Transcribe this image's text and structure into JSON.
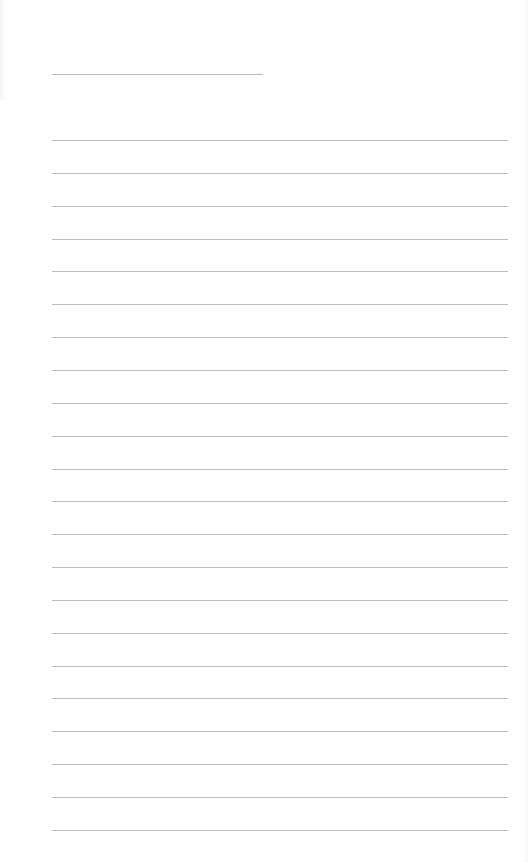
{
  "page": {
    "type": "lined-paper",
    "background": "#ffffff",
    "line_color": "#bdbdbd",
    "title_line": {
      "text": "",
      "left": 52,
      "top": 74,
      "width": 211
    },
    "rule_lines": {
      "count": 22,
      "left": 52,
      "width": 456,
      "first_top": 140,
      "spacing": 32.85,
      "texts": [
        "",
        "",
        "",
        "",
        "",
        "",
        "",
        "",
        "",
        "",
        "",
        "",
        "",
        "",
        "",
        "",
        "",
        "",
        "",
        "",
        "",
        ""
      ]
    }
  }
}
